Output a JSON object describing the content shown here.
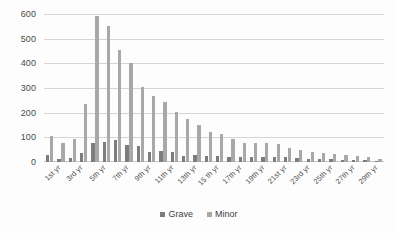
{
  "chart_data": {
    "type": "bar",
    "title": "",
    "subtitle": "",
    "xlabel": "",
    "ylabel": "",
    "ylim": [
      0,
      600
    ],
    "yticks": [
      0,
      100,
      200,
      300,
      400,
      500,
      600
    ],
    "grid": true,
    "legend_position": "bottom",
    "categories": [
      "1st yr",
      "2nd yr",
      "3rd yr",
      "4th yr",
      "5th yr",
      "6th yr",
      "7th yr",
      "8th yr",
      "9th yr",
      "10th yr",
      "11th yr",
      "12th yr",
      "13th yr",
      "14th yr",
      "15 th yr",
      "16th yr",
      "17th yr",
      "18th yr",
      "19th yr",
      "20th yr",
      "21st yr",
      "22nd yr",
      "23rd yr",
      "24th yr",
      "25th yr",
      "26th yr",
      "27th yr",
      "28th yr",
      "29th yr",
      "30th yr"
    ],
    "tick_labels": [
      "1st yr",
      "3rd yr",
      "5th yr",
      "7th yr",
      "9th yr",
      "11th yr",
      "13th yr",
      "15 th yr",
      "17th yr",
      "19th yr",
      "21st yr",
      "23rd yr",
      "25th yr",
      "27th yr",
      "29th yr"
    ],
    "series": [
      {
        "name": "Grave",
        "color": "#7d7d7d",
        "values": [
          28,
          12,
          16,
          38,
          78,
          80,
          88,
          70,
          66,
          40,
          46,
          40,
          26,
          30,
          24,
          24,
          22,
          22,
          22,
          22,
          22,
          20,
          16,
          14,
          12,
          12,
          10,
          10,
          8,
          6
        ]
      },
      {
        "name": "Minor",
        "color": "#a8a8a8",
        "values": [
          104,
          76,
          94,
          236,
          590,
          553,
          453,
          402,
          306,
          268,
          245,
          204,
          176,
          150,
          121,
          114,
          94,
          76,
          77,
          79,
          75,
          58,
          48,
          41,
          36,
          33,
          30,
          26,
          22,
          12
        ]
      }
    ]
  },
  "legend": {
    "items": [
      {
        "label": "Grave",
        "color": "#7d7d7d"
      },
      {
        "label": "Minor",
        "color": "#a8a8a8"
      }
    ]
  }
}
